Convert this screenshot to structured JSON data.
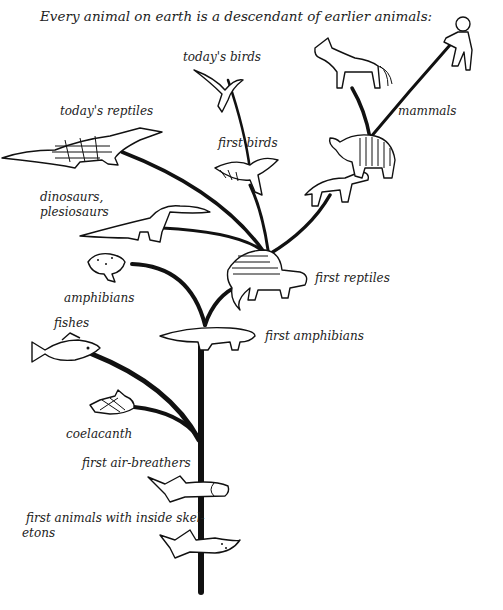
{
  "title": "Every animal on earth is a descendant of earlier animals:",
  "labels": {
    "todays_birds": "today's birds",
    "todays_reptiles": "today's reptiles",
    "first_birds": "first birds",
    "mammals": "mammals",
    "dinosaurs_line1": "dinosaurs,",
    "dinosaurs_line2": "plesiosaurs",
    "first_reptiles": "first reptiles",
    "amphibians": "amphibians",
    "fishes": "fishes",
    "first_amphibians": "first amphibians",
    "coelacanth": "coelacanth",
    "first_air_breathers": "first air-breathers",
    "first_skeletons_line1": "first animals with inside skel-",
    "first_skeletons_line2": "etons"
  },
  "colors": {
    "ink": "#111111",
    "background": "#ffffff"
  }
}
